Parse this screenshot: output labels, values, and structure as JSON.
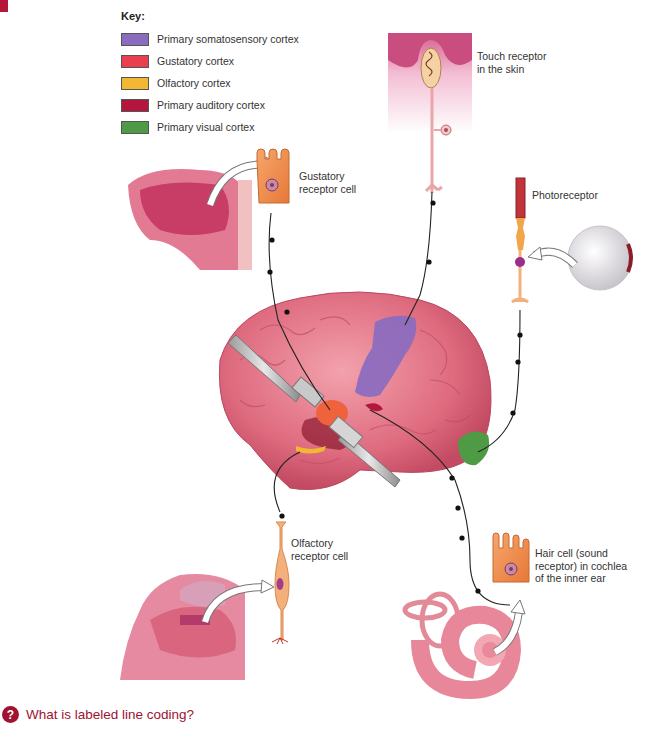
{
  "figure": {
    "marker_color": "#b5173a"
  },
  "key": {
    "title": "Key:",
    "items": [
      {
        "label": "Primary somatosensory cortex",
        "color": "#8a6bc0"
      },
      {
        "label": "Gustatory cortex",
        "color": "#e8404e"
      },
      {
        "label": "Olfactory cortex",
        "color": "#f2b733"
      },
      {
        "label": "Primary auditory cortex",
        "color": "#b3173e"
      },
      {
        "label": "Primary visual cortex",
        "color": "#4f9a45"
      }
    ]
  },
  "labels": {
    "touch": [
      "Touch receptor",
      "in the skin"
    ],
    "gustatory": [
      "Gustatory",
      "receptor cell"
    ],
    "photoreceptor": [
      "Photoreceptor"
    ],
    "olfactory": [
      "Olfactory",
      "receptor cell"
    ],
    "hair_cell": [
      "Hair cell (sound",
      "receptor) in cochlea",
      "of the inner ear"
    ]
  },
  "question": {
    "icon": "?",
    "text": "What is labeled line coding?"
  }
}
